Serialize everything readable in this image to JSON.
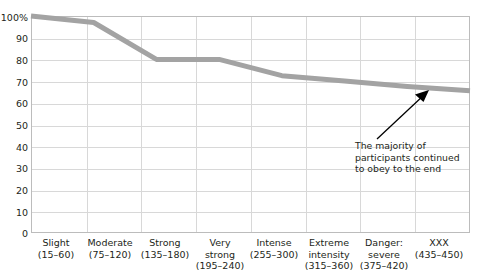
{
  "chart_data": {
    "type": "line",
    "title": "",
    "xlabel": "",
    "ylabel": "",
    "ylim": [
      0,
      100
    ],
    "grid": true,
    "legend": false,
    "y_ticks": [
      "100%",
      "90",
      "80",
      "70",
      "60",
      "50",
      "40",
      "30",
      "20",
      "10",
      "0"
    ],
    "y_tick_values": [
      100,
      90,
      80,
      70,
      60,
      50,
      40,
      30,
      20,
      10,
      0
    ],
    "categories": [
      "Slight (15–60)",
      "Moderate (75–120)",
      "Strong (135–180)",
      "Very strong (195–240)",
      "Intense (255–300)",
      "Extreme intensity (315–360)",
      "Danger: severe (375–420)",
      "XXX (435–450)"
    ],
    "category_labels": [
      {
        "name": "Slight",
        "range": "(15–60)"
      },
      {
        "name": "Moderate",
        "range": "(75–120)"
      },
      {
        "name": "Strong",
        "range": "(135–180)"
      },
      {
        "name": "Very strong",
        "range": "(195–240)"
      },
      {
        "name": "Intense",
        "range": "(255–300)"
      },
      {
        "name": "Extreme intensity",
        "range": "(315–360)"
      },
      {
        "name": "Danger: severe",
        "range": "(375–420)"
      },
      {
        "name": "XXX",
        "range": "(435–450)"
      }
    ],
    "values": [
      100,
      97,
      80,
      80,
      72.5,
      70,
      67.5,
      65.5
    ],
    "series": [
      {
        "name": "Percent of participants continuing",
        "values": [
          100,
          97,
          80,
          80,
          72.5,
          70,
          67.5,
          65.5
        ]
      }
    ],
    "line_color": "#a3a3a3",
    "line_width": 5
  },
  "annotation": {
    "line1": "The majority of",
    "line2": "participants continued",
    "line3": "to obey to the end",
    "arrow_color": "#000000"
  }
}
